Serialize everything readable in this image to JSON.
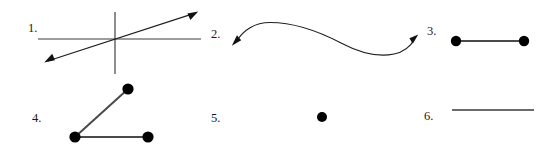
{
  "page": {
    "background_color": "#ffffff",
    "ink_color": "#1a1a1a",
    "width": 551,
    "height": 153,
    "kind": "geometry-worksheet-figures"
  },
  "figures": [
    {
      "number": "1.",
      "name": "three-lines-through-common-point",
      "label_x": 28,
      "label_y": 32,
      "description": "horizontal line, vertical line and a double-headed diagonal arrow all crossing at one point",
      "parts": {
        "horizontal_line": {
          "x1": 38,
          "y1": 39,
          "x2": 201,
          "y2": 39
        },
        "vertical_line": {
          "x1": 115,
          "y1": 12,
          "x2": 115,
          "y2": 74
        },
        "diagonal_arrow": {
          "x1": 45,
          "y1": 62,
          "x2": 197,
          "y2": 12,
          "arrowheads": "both"
        }
      }
    },
    {
      "number": "2.",
      "name": "double-headed-s-curve",
      "label_x": 211,
      "label_y": 38,
      "description": "smooth S shaped curve with arrowheads at both ends",
      "parts": {
        "curve": {
          "start_x": 233,
          "start_y": 44,
          "end_x": 417,
          "end_y": 36,
          "arrowheads": "both"
        }
      }
    },
    {
      "number": "3.",
      "name": "segment-with-two-endpoints",
      "label_x": 427,
      "label_y": 35,
      "description": "horizontal segment with solid dots marking both endpoints",
      "parts": {
        "segment": {
          "x1": 456,
          "y1": 41,
          "x2": 524,
          "y2": 41
        },
        "dots": [
          {
            "cx": 456,
            "cy": 41,
            "r": 5.2
          },
          {
            "cx": 524,
            "cy": 41,
            "r": 5.2
          }
        ]
      }
    },
    {
      "number": "4.",
      "name": "two-joined-segments-angle",
      "label_x": 32,
      "label_y": 122,
      "description": "two segments meeting at a bottom-left vertex forming an angle, three solid dots",
      "parts": {
        "segment_up": {
          "x1": 75,
          "y1": 137,
          "x2": 128,
          "y2": 89
        },
        "segment_right": {
          "x1": 75,
          "y1": 137,
          "x2": 148,
          "y2": 137
        },
        "dots": [
          {
            "cx": 128,
            "cy": 89,
            "r": 5.6
          },
          {
            "cx": 75,
            "cy": 137,
            "r": 5.6
          },
          {
            "cx": 148,
            "cy": 137,
            "r": 5.6
          }
        ]
      }
    },
    {
      "number": "5.",
      "name": "single-point",
      "label_x": 211,
      "label_y": 122,
      "description": "one isolated solid dot",
      "parts": {
        "dots": [
          {
            "cx": 322,
            "cy": 117,
            "r": 5.0
          }
        ]
      }
    },
    {
      "number": "6.",
      "name": "plain-segment",
      "label_x": 424,
      "label_y": 120,
      "description": "a plain horizontal line segment with no marked endpoints",
      "parts": {
        "segment": {
          "x1": 452,
          "y1": 110,
          "x2": 534,
          "y2": 110
        }
      }
    }
  ]
}
